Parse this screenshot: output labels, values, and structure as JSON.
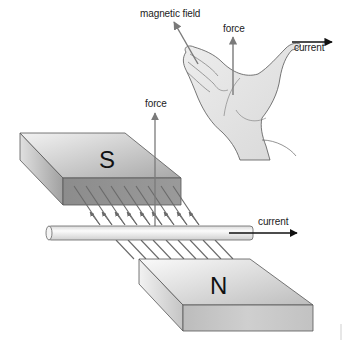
{
  "diagram": {
    "hand_labels": {
      "magnetic_field": "magnetic field",
      "force": "force",
      "current": "current"
    },
    "apparatus_labels": {
      "force": "force",
      "current": "current"
    },
    "magnets": {
      "top_pole": "S",
      "bottom_pole": "N"
    },
    "field_line_count": 9,
    "colors": {
      "arrow_gray": "#7a7a7a",
      "arrow_black": "#111111",
      "magnet_top": "#c9c9c9",
      "magnet_front_dark": "#8f8f8f",
      "skin": "#e4e4e4"
    }
  }
}
